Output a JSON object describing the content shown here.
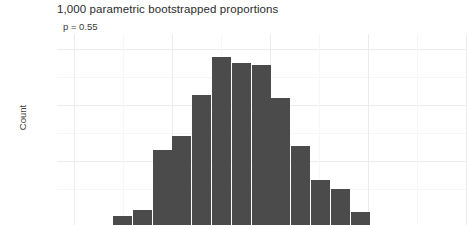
{
  "chart_data": {
    "type": "bar",
    "title": "1,000 parametric bootstrapped proportions",
    "subtitle": "p = 0.55",
    "xlabel": "",
    "ylabel": "Count",
    "ylim": [
      0,
      160
    ],
    "yticks": [
      50,
      100,
      150
    ],
    "ytick_labels": [
      "50",
      "100",
      "150"
    ],
    "grid": true,
    "legend": false,
    "bar_color": "#4b4b4b",
    "note": "x axis tick labels are cropped out of the visible screenshot",
    "categories": [
      "b1",
      "b2",
      "b3",
      "b4",
      "b5",
      "b6",
      "b7",
      "b8",
      "b9",
      "b10",
      "b11",
      "b12",
      "b13"
    ],
    "values": [
      8,
      13,
      67,
      80,
      116,
      150,
      145,
      143,
      114,
      71,
      40,
      32,
      12
    ]
  },
  "chart": {
    "title": "1,000 parametric bootstrapped proportions",
    "subtitle": "p = 0.55",
    "ylabel": "Count",
    "yticks": [
      "150",
      "100",
      "50"
    ]
  }
}
